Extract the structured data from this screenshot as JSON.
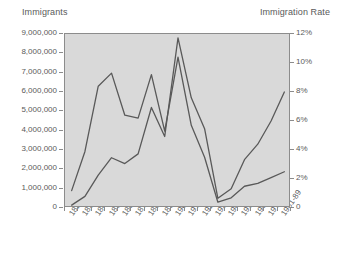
{
  "chart_data": {
    "type": "line",
    "title": "",
    "categories": [
      "1821-30",
      "1831-40",
      "1841-50",
      "1851-60",
      "1861-70",
      "1871-80",
      "1881-90",
      "1891-00",
      "1901-10",
      "1911-20",
      "1921-30",
      "1931-40",
      "1941-50",
      "1951-60",
      "1961-70",
      "1971-80",
      "1981-89"
    ],
    "series": [
      {
        "name": "Immigrants",
        "axis": "left",
        "ylabel": "Immigrants",
        "values": [
          150000,
          600000,
          1700000,
          2600000,
          2300000,
          2800000,
          5200000,
          3700000,
          8800000,
          5700000,
          4100000,
          500000,
          1000000,
          2500000,
          3300000,
          4500000,
          6000000
        ]
      },
      {
        "name": "Immigration Rate",
        "axis": "right",
        "ylabel": "Immigration Rate",
        "values": [
          1.2,
          3.9,
          8.4,
          9.3,
          6.4,
          6.2,
          9.2,
          5.3,
          10.4,
          5.7,
          3.5,
          0.4,
          0.7,
          1.5,
          1.7,
          2.1,
          2.5
        ]
      }
    ],
    "ylim_left": [
      0,
      9000000
    ],
    "ylim_right": [
      0,
      12
    ],
    "yticks_left": [
      "0",
      "1,000,000",
      "2,000,000",
      "3,000,000",
      "4,000,000",
      "5,000,000",
      "6,000,000",
      "7,000,000",
      "8,000,000",
      "9,000,000"
    ],
    "yticks_right": [
      "0",
      "2%",
      "4%",
      "6%",
      "8%",
      "10%",
      "12%"
    ],
    "xlabel": "",
    "grid": false,
    "legend": "none",
    "colors": {
      "plot_background": "#d9d9d9",
      "line": "#595959",
      "axis": "#8c8c8c",
      "text": "#5a5a5a"
    }
  },
  "labels": {
    "left_axis_title": "Immigrants",
    "right_axis_title": "Immigration Rate"
  }
}
